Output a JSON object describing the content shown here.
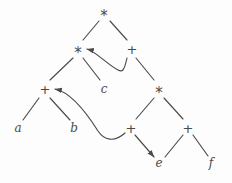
{
  "figure": {
    "background_color": "#fdfdfd",
    "stroke_color": "#4a4a4a",
    "width": 232,
    "height": 183
  },
  "nodes": [
    {
      "id": "n0",
      "label": "*",
      "kind": "operator",
      "x": 104,
      "y": 12
    },
    {
      "id": "n1",
      "label": "*",
      "kind": "operator",
      "x": 78,
      "y": 49
    },
    {
      "id": "n2",
      "label": "+",
      "kind": "operator",
      "x": 132,
      "y": 49
    },
    {
      "id": "n3",
      "label": "+",
      "kind": "operator",
      "x": 45,
      "y": 89
    },
    {
      "id": "n4",
      "label": "c",
      "kind": "leaf",
      "x": 104,
      "y": 89
    },
    {
      "id": "n5",
      "label": "*",
      "kind": "operator",
      "x": 159,
      "y": 89
    },
    {
      "id": "n6",
      "label": "a",
      "kind": "leaf",
      "x": 18,
      "y": 128
    },
    {
      "id": "n7",
      "label": "b",
      "kind": "leaf",
      "x": 74,
      "y": 128
    },
    {
      "id": "n8",
      "label": "+",
      "kind": "operator",
      "x": 131,
      "y": 128
    },
    {
      "id": "n9",
      "label": "+",
      "kind": "operator",
      "x": 188,
      "y": 128
    },
    {
      "id": "n10",
      "label": "e",
      "kind": "leaf",
      "x": 159,
      "y": 163
    },
    {
      "id": "n11",
      "label": "f",
      "kind": "leaf",
      "x": 211,
      "y": 163
    }
  ],
  "edges": [
    {
      "from": "n0",
      "to": "n1",
      "shape": "line",
      "arrow": false,
      "path": "M 99 21 L 83 40"
    },
    {
      "from": "n0",
      "to": "n2",
      "shape": "line",
      "arrow": false,
      "path": "M 110 21 L 127 40"
    },
    {
      "from": "n1",
      "to": "n3",
      "shape": "line",
      "arrow": false,
      "path": "M 73 58 L 50 80"
    },
    {
      "from": "n1",
      "to": "n4",
      "shape": "line",
      "arrow": false,
      "path": "M 83 58 L 100 80"
    },
    {
      "from": "n2",
      "to": "n1",
      "shape": "curve",
      "arrow": true,
      "path": "M 127 58 C 124 72 122 72 118 70 C 108 65 95 51 87 49"
    },
    {
      "from": "n2",
      "to": "n5",
      "shape": "line",
      "arrow": false,
      "path": "M 136 58 L 154 80"
    },
    {
      "from": "n3",
      "to": "n6",
      "shape": "line",
      "arrow": false,
      "path": "M 39 98 L 23 120"
    },
    {
      "from": "n3",
      "to": "n7",
      "shape": "line",
      "arrow": false,
      "path": "M 50 98 L 70 120"
    },
    {
      "from": "n5",
      "to": "n8",
      "shape": "line",
      "arrow": false,
      "path": "M 154 98 L 136 119"
    },
    {
      "from": "n5",
      "to": "n9",
      "shape": "line",
      "arrow": false,
      "path": "M 164 98 L 183 119"
    },
    {
      "from": "n8",
      "to": "n3",
      "shape": "curve",
      "arrow": true,
      "path": "M 125 133 C 114 143 104 140 98 131 C 86 112 70 92 55 89"
    },
    {
      "from": "n8",
      "to": "n10",
      "shape": "line",
      "arrow": true,
      "path": "M 135 135 L 154 157"
    },
    {
      "from": "n9",
      "to": "n10",
      "shape": "line",
      "arrow": false,
      "path": "M 183 135 L 165 157"
    },
    {
      "from": "n9",
      "to": "n11",
      "shape": "line",
      "arrow": false,
      "path": "M 193 135 L 208 156"
    }
  ]
}
